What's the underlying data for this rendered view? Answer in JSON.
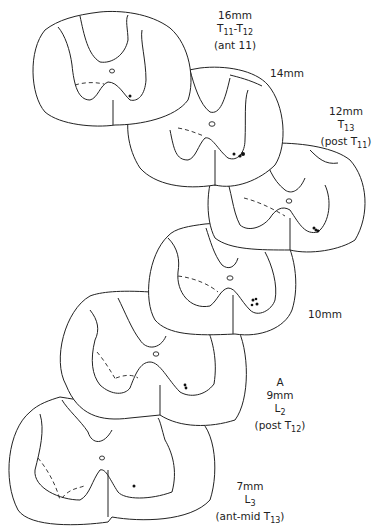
{
  "figure": {
    "sections": [
      {
        "id": "s16",
        "length": "16mm",
        "segment": "T11-T12",
        "segment_main": "T",
        "segment_sub_a": "11",
        "segment_sep": "-T",
        "segment_sub_b": "12",
        "note": "(ant 11)"
      },
      {
        "id": "s14",
        "length": "14mm"
      },
      {
        "id": "s12",
        "length": "12mm",
        "segment_main": "T",
        "segment_sub": "13",
        "note_pre": "(post T",
        "note_sub": "11",
        "note_post": ")"
      },
      {
        "id": "s10",
        "length": "10mm"
      },
      {
        "id": "s9",
        "marker": "A",
        "length": "9mm",
        "segment_main": "L",
        "segment_sub": "2",
        "note_pre": "(post T",
        "note_sub": "12",
        "note_post": ")"
      },
      {
        "id": "s7",
        "length": "7mm",
        "segment_main": "L",
        "segment_sub": "3",
        "note_pre": "(ant-mid T",
        "note_sub": "13",
        "note_post": ")"
      }
    ]
  }
}
